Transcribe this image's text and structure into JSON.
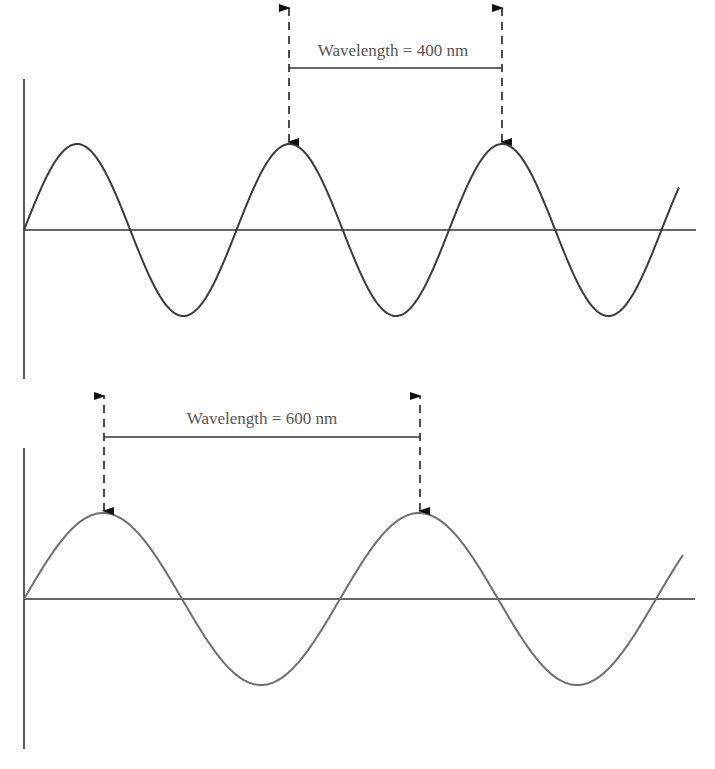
{
  "figure": {
    "top_wave": {
      "label": "Wavelength = 400 nm",
      "wavelength_nm": 400,
      "color": "#3a3a3a",
      "axis_x": 24,
      "baseline_y": 230,
      "axis_top": 79,
      "axis_bottom": 379,
      "baseline_end": 696,
      "amplitude": 86,
      "start_x": 24,
      "end_x": 679,
      "period_px": 212.5,
      "bracket": {
        "x1": 289,
        "x2": 502,
        "y": 68,
        "arrow_top": 8,
        "arrow_bottom": 142,
        "label_x": 393,
        "label_y": 56
      }
    },
    "bottom_wave": {
      "label": "Wavelength = 600 nm",
      "wavelength_nm": 600,
      "color": "#6e6e6e",
      "axis_x": 24,
      "baseline_y": 599,
      "axis_top": 448,
      "axis_bottom": 749,
      "baseline_end": 695,
      "amplitude": 86,
      "start_x": 24,
      "end_x": 683,
      "period_px": 316,
      "bracket": {
        "x1": 104,
        "x2": 420,
        "y": 437,
        "arrow_top": 396,
        "arrow_bottom": 511,
        "label_x": 262,
        "label_y": 424
      }
    }
  }
}
